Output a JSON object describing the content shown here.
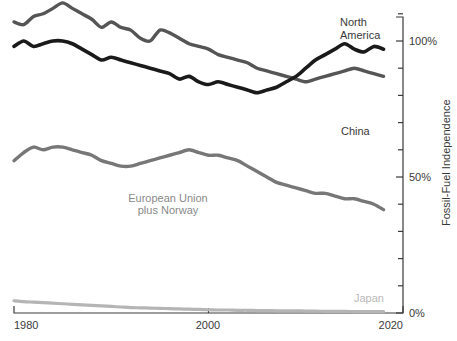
{
  "chart_data": {
    "type": "line",
    "title": "",
    "subtitle": "",
    "xlabel": "",
    "ylabel": "Fossil-Fuel Independence",
    "xlim": [
      1980,
      2020
    ],
    "ylim": [
      0,
      115
    ],
    "grid": false,
    "legend_position": "inline-annotations",
    "x_ticks": [
      "1980",
      "2000",
      "2020"
    ],
    "x_tick_values": [
      1980,
      2000,
      2020
    ],
    "y_ticks": [
      "0%",
      "50%",
      "100%"
    ],
    "y_tick_values": [
      0,
      50,
      100
    ],
    "y_minor_tick_values": [
      10,
      20,
      30,
      40,
      60,
      70,
      80,
      90,
      110
    ],
    "x": [
      1980,
      1981,
      1982,
      1983,
      1984,
      1985,
      1986,
      1987,
      1988,
      1989,
      1990,
      1991,
      1992,
      1993,
      1994,
      1995,
      1996,
      1997,
      1998,
      1999,
      2000,
      2001,
      2002,
      2003,
      2004,
      2005,
      2006,
      2007,
      2008,
      2009,
      2010,
      2011,
      2012,
      2013,
      2014,
      2015,
      2016,
      2017,
      2018
    ],
    "series": [
      {
        "name": "North America",
        "color": "#555555",
        "label_lines": [
          "North",
          "America"
        ],
        "values": [
          107,
          106,
          109,
          110,
          112,
          114,
          112,
          110,
          108,
          105,
          107,
          105,
          104,
          101,
          100,
          104,
          103,
          101,
          99,
          98,
          97,
          95,
          94,
          93,
          92,
          90,
          89,
          88,
          87,
          86,
          85,
          86,
          87,
          88,
          89,
          90,
          89,
          88,
          87
        ]
      },
      {
        "name": "China",
        "color": "#1a1a1a",
        "label_lines": [
          "China"
        ],
        "values": [
          98,
          100,
          98,
          99,
          100,
          100,
          99,
          97,
          95,
          93,
          94,
          93,
          92,
          91,
          90,
          89,
          88,
          86,
          87,
          85,
          84,
          85,
          84,
          83,
          82,
          81,
          82,
          83,
          85,
          87,
          90,
          93,
          95,
          97,
          99,
          97,
          96,
          98,
          97
        ]
      },
      {
        "name": "European Union plus Norway",
        "color": "#777777",
        "label_lines": [
          "European Union",
          "plus Norway"
        ],
        "values": [
          56,
          59,
          61,
          60,
          61,
          61,
          60,
          59,
          58,
          56,
          55,
          54,
          54,
          55,
          56,
          57,
          58,
          59,
          60,
          59,
          58,
          58,
          57,
          56,
          54,
          52,
          50,
          48,
          47,
          46,
          45,
          44,
          44,
          43,
          42,
          42,
          41,
          40,
          38
        ]
      },
      {
        "name": "Japan",
        "color": "#b5b5b5",
        "label_lines": [
          "Japan"
        ],
        "values": [
          4.5,
          4.2,
          4.0,
          3.8,
          3.6,
          3.4,
          3.2,
          3.0,
          2.8,
          2.6,
          2.4,
          2.2,
          2.0,
          1.9,
          1.8,
          1.7,
          1.6,
          1.5,
          1.4,
          1.3,
          1.2,
          1.1,
          1.1,
          1.0,
          1.0,
          0.9,
          0.9,
          0.8,
          0.8,
          0.8,
          0.7,
          0.7,
          0.6,
          0.6,
          0.6,
          0.5,
          0.5,
          0.5,
          0.5
        ]
      }
    ]
  },
  "labels": {
    "y_axis_title": "Fossil-Fuel Independence",
    "x_tick_1980": "1980",
    "x_tick_2000": "2000",
    "x_tick_2020": "2020",
    "y_tick_0": "0%",
    "y_tick_50": "50%",
    "y_tick_100": "100%",
    "series_north_america_line1": "North",
    "series_north_america_line2": "America",
    "series_china": "China",
    "series_eu_line1": "European Union",
    "series_eu_line2": "plus Norway",
    "series_japan": "Japan"
  },
  "colors": {
    "north_america": "#555555",
    "china": "#1a1a1a",
    "european_union": "#777777",
    "japan": "#b5b5b5",
    "axis": "#3a3a3a",
    "background": "#ffffff"
  }
}
